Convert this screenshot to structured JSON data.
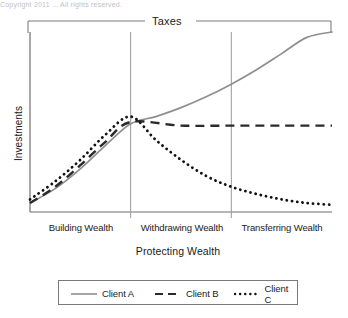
{
  "partial_top_text": "Copyright 2011 ... All rights reserved.",
  "chart_data": {
    "type": "line",
    "title": "",
    "top_bracket_label": "Taxes",
    "ylabel": "Investments",
    "xlabel": "Protecting Wealth",
    "x_segments": [
      "Building Wealth",
      "Withdrawing Wealth",
      "Transferring Wealth"
    ],
    "xlim": [
      0,
      3
    ],
    "ylim": [
      0,
      1
    ],
    "grid": false,
    "axis_ticks": false,
    "legend_position": "bottom",
    "segment_divider_x": [
      1,
      2
    ],
    "series": [
      {
        "name": "Client A",
        "style": "solid",
        "color": "#8f8f8f",
        "x": [
          0.0,
          0.25,
          0.5,
          0.75,
          1.0,
          1.25,
          1.5,
          1.75,
          2.0,
          2.25,
          2.5,
          2.75,
          3.0
        ],
        "values": [
          0.05,
          0.13,
          0.24,
          0.37,
          0.49,
          0.53,
          0.58,
          0.64,
          0.71,
          0.79,
          0.88,
          0.97,
          1.0
        ]
      },
      {
        "name": "Client B",
        "style": "dashed",
        "color": "#2a2a2a",
        "x": [
          0.0,
          0.25,
          0.5,
          0.75,
          1.0,
          1.5,
          2.0,
          2.5,
          3.0
        ],
        "values": [
          0.05,
          0.14,
          0.26,
          0.39,
          0.5,
          0.48,
          0.48,
          0.48,
          0.48
        ]
      },
      {
        "name": "Client C",
        "style": "dotted",
        "color": "#111111",
        "x": [
          0.0,
          0.25,
          0.5,
          0.75,
          1.0,
          1.25,
          1.5,
          1.75,
          2.0,
          2.25,
          2.5,
          2.75,
          3.0
        ],
        "values": [
          0.07,
          0.17,
          0.29,
          0.43,
          0.53,
          0.4,
          0.29,
          0.2,
          0.14,
          0.1,
          0.07,
          0.05,
          0.04
        ]
      }
    ],
    "legend": [
      {
        "label": "Client A",
        "style": "solid",
        "color": "#8f8f8f"
      },
      {
        "label": "Client B",
        "style": "dashed",
        "color": "#2a2a2a"
      },
      {
        "label": "Client C",
        "style": "dotted",
        "color": "#111111"
      }
    ]
  }
}
